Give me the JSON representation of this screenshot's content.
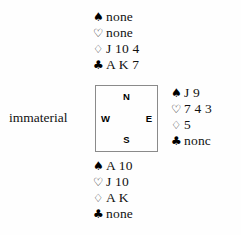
{
  "diagram": {
    "type": "bridge-hand-diagram",
    "suit_symbols": {
      "spade": "♠",
      "heart": "♡",
      "diamond": "♢",
      "club": "♣"
    },
    "compass": {
      "north": "N",
      "south": "S",
      "east": "E",
      "west": "W"
    },
    "hands": {
      "north": {
        "spades": "none",
        "hearts": "none",
        "diamonds": "J 10 4",
        "clubs": "A K 7"
      },
      "east": {
        "spades": "J 9",
        "hearts": "7 4 3",
        "diamonds": "5",
        "clubs": "nonc"
      },
      "south": {
        "spades": "A 10",
        "hearts": "J 10",
        "diamonds": "A K",
        "clubs": "none"
      },
      "west": {
        "label": "immaterial"
      }
    }
  }
}
